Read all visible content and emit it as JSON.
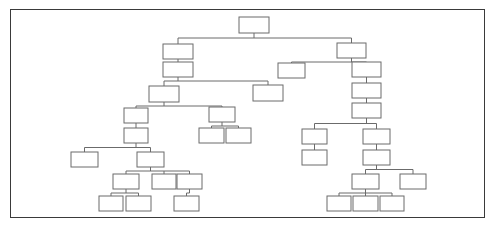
{
  "canvas": {
    "width": 497,
    "height": 230,
    "background": "#ffffff"
  },
  "frame": {
    "x": 10,
    "y": 9,
    "width": 475,
    "height": 209,
    "border_color": "#3a3a3a",
    "fill": "#ffffff"
  },
  "diagram": {
    "type": "tree",
    "title": "",
    "node_fill": "#ffffff",
    "node_stroke": "#6b6b6b",
    "edge_stroke": "#6b6b6b",
    "node_label_text": "",
    "node_count": 38,
    "nodes": [
      {
        "id": "n1",
        "label": "",
        "x": 239,
        "y": 17,
        "w": 30,
        "h": 16
      },
      {
        "id": "n2",
        "label": "",
        "x": 163,
        "y": 44,
        "w": 30,
        "h": 15
      },
      {
        "id": "n3",
        "label": "",
        "x": 163,
        "y": 62,
        "w": 30,
        "h": 15
      },
      {
        "id": "n4",
        "label": "",
        "x": 149,
        "y": 86,
        "w": 30,
        "h": 16
      },
      {
        "id": "n5",
        "label": "",
        "x": 253,
        "y": 85,
        "w": 30,
        "h": 16
      },
      {
        "id": "n6",
        "label": "",
        "x": 124,
        "y": 108,
        "w": 24,
        "h": 15
      },
      {
        "id": "n7",
        "label": "",
        "x": 124,
        "y": 128,
        "w": 24,
        "h": 15
      },
      {
        "id": "n8",
        "label": "",
        "x": 209,
        "y": 107,
        "w": 26,
        "h": 15
      },
      {
        "id": "n9",
        "label": "",
        "x": 199,
        "y": 128,
        "w": 25,
        "h": 15
      },
      {
        "id": "n10",
        "label": "",
        "x": 226,
        "y": 128,
        "w": 25,
        "h": 15
      },
      {
        "id": "n11",
        "label": "",
        "x": 71,
        "y": 152,
        "w": 27,
        "h": 15
      },
      {
        "id": "n12",
        "label": "",
        "x": 137,
        "y": 152,
        "w": 27,
        "h": 15
      },
      {
        "id": "n13",
        "label": "",
        "x": 113,
        "y": 174,
        "w": 26,
        "h": 15
      },
      {
        "id": "n14",
        "label": "",
        "x": 152,
        "y": 174,
        "w": 24,
        "h": 15
      },
      {
        "id": "n15",
        "label": "",
        "x": 177,
        "y": 174,
        "w": 25,
        "h": 15
      },
      {
        "id": "n16",
        "label": "",
        "x": 99,
        "y": 196,
        "w": 24,
        "h": 15
      },
      {
        "id": "n17",
        "label": "",
        "x": 126,
        "y": 196,
        "w": 25,
        "h": 15
      },
      {
        "id": "n18",
        "label": "",
        "x": 174,
        "y": 196,
        "w": 25,
        "h": 15
      },
      {
        "id": "n19",
        "label": "",
        "x": 337,
        "y": 43,
        "w": 29,
        "h": 15
      },
      {
        "id": "n20",
        "label": "",
        "x": 278,
        "y": 63,
        "w": 27,
        "h": 15
      },
      {
        "id": "n21",
        "label": "",
        "x": 352,
        "y": 62,
        "w": 29,
        "h": 15
      },
      {
        "id": "n22",
        "label": "",
        "x": 352,
        "y": 83,
        "w": 29,
        "h": 15
      },
      {
        "id": "n23",
        "label": "",
        "x": 352,
        "y": 103,
        "w": 29,
        "h": 15
      },
      {
        "id": "n24",
        "label": "",
        "x": 302,
        "y": 129,
        "w": 25,
        "h": 15
      },
      {
        "id": "n25",
        "label": "",
        "x": 302,
        "y": 150,
        "w": 25,
        "h": 15
      },
      {
        "id": "n26",
        "label": "",
        "x": 363,
        "y": 129,
        "w": 27,
        "h": 15
      },
      {
        "id": "n27",
        "label": "",
        "x": 363,
        "y": 150,
        "w": 27,
        "h": 15
      },
      {
        "id": "n28",
        "label": "",
        "x": 352,
        "y": 174,
        "w": 27,
        "h": 15
      },
      {
        "id": "n29",
        "label": "",
        "x": 400,
        "y": 174,
        "w": 26,
        "h": 15
      },
      {
        "id": "n30",
        "label": "",
        "x": 327,
        "y": 196,
        "w": 24,
        "h": 15
      },
      {
        "id": "n31",
        "label": "",
        "x": 353,
        "y": 196,
        "w": 25,
        "h": 15
      },
      {
        "id": "n32",
        "label": "",
        "x": 380,
        "y": 196,
        "w": 24,
        "h": 15
      }
    ],
    "edges": [
      {
        "from": "n1",
        "to": "n2"
      },
      {
        "from": "n1",
        "to": "n19"
      },
      {
        "from": "n2",
        "to": "n3"
      },
      {
        "from": "n3",
        "to": "n4"
      },
      {
        "from": "n3",
        "to": "n5"
      },
      {
        "from": "n4",
        "to": "n6"
      },
      {
        "from": "n4",
        "to": "n8"
      },
      {
        "from": "n6",
        "to": "n7"
      },
      {
        "from": "n8",
        "to": "n9"
      },
      {
        "from": "n8",
        "to": "n10"
      },
      {
        "from": "n7",
        "to": "n11"
      },
      {
        "from": "n7",
        "to": "n12"
      },
      {
        "from": "n12",
        "to": "n13"
      },
      {
        "from": "n12",
        "to": "n14"
      },
      {
        "from": "n12",
        "to": "n15"
      },
      {
        "from": "n13",
        "to": "n16"
      },
      {
        "from": "n13",
        "to": "n17"
      },
      {
        "from": "n15",
        "to": "n18"
      },
      {
        "from": "n19",
        "to": "n20"
      },
      {
        "from": "n19",
        "to": "n21"
      },
      {
        "from": "n21",
        "to": "n22"
      },
      {
        "from": "n22",
        "to": "n23"
      },
      {
        "from": "n23",
        "to": "n24"
      },
      {
        "from": "n23",
        "to": "n26"
      },
      {
        "from": "n24",
        "to": "n25"
      },
      {
        "from": "n26",
        "to": "n27"
      },
      {
        "from": "n27",
        "to": "n28"
      },
      {
        "from": "n27",
        "to": "n29"
      },
      {
        "from": "n28",
        "to": "n30"
      },
      {
        "from": "n28",
        "to": "n31"
      },
      {
        "from": "n28",
        "to": "n32"
      }
    ]
  }
}
